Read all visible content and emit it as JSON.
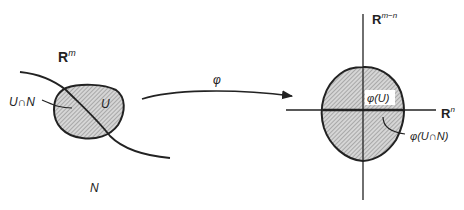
{
  "left_space": {
    "label": "R",
    "label_sup": "m",
    "open_set_label": "U",
    "intersection_label": "U∩N",
    "submanifold_label": "N"
  },
  "map": {
    "label": "φ"
  },
  "right_space": {
    "vertical_axis_label": "R",
    "vertical_axis_sup": "m−n",
    "horizontal_axis_label": "R",
    "horizontal_axis_sup": "n",
    "image_label": "φ(U)",
    "image_intersection_label": "φ(U∩N)"
  },
  "colors": {
    "stroke": "#222222",
    "fill_hatch_bg": "#cfcfcf",
    "background": "#ffffff"
  }
}
